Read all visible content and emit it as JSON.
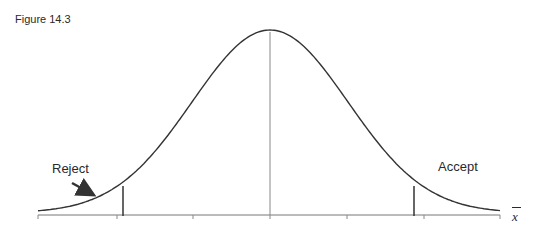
{
  "figure": {
    "label": "Figure 14.3",
    "type": "normal-distribution-decision-diagram"
  },
  "annotations": {
    "reject": "Reject",
    "accept": "Accept",
    "x_axis_symbol": "x",
    "x_axis_symbol_overbar": true
  },
  "geometry": {
    "axis": {
      "y": 215,
      "x_start": 38,
      "x_end": 500
    },
    "ticks_x": [
      38,
      117,
      193,
      270,
      347,
      424,
      500
    ],
    "mean_line_x": 270,
    "critical_lines_x": [
      123,
      414
    ],
    "horizontal_reference_y": 122,
    "horizontal_reference_x": [
      22,
      505
    ],
    "peak": {
      "x": 270,
      "y": 32
    }
  },
  "colors": {
    "line": "#333333",
    "thin_line": "#777777",
    "reference_end": "#5fbf4f"
  }
}
